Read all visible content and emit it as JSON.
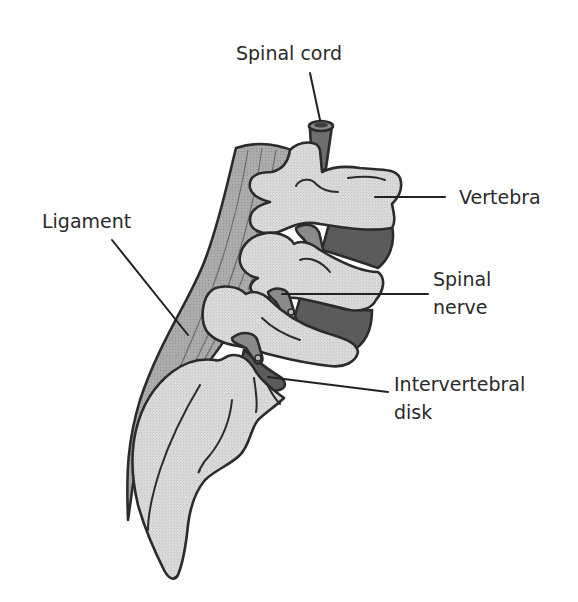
{
  "diagram": {
    "labels": [
      {
        "id": "spinal-cord",
        "text": "Spinal cord"
      },
      {
        "id": "vertebra",
        "text": "Vertebra"
      },
      {
        "id": "ligament",
        "text": "Ligament"
      },
      {
        "id": "spinal-nerve",
        "lines": [
          "Spinal",
          "nerve"
        ]
      },
      {
        "id": "intervertebral-disk",
        "lines": [
          "Intervertebral",
          "disk"
        ]
      }
    ],
    "colors": {
      "background": "#ffffff",
      "bone": "#d8d8d8",
      "ligament": "#a9a9a9",
      "disk": "#5b5b5b",
      "nerve": "#8a8a8a",
      "outline": "#2b2b2b",
      "text": "#2a2a2a"
    }
  }
}
